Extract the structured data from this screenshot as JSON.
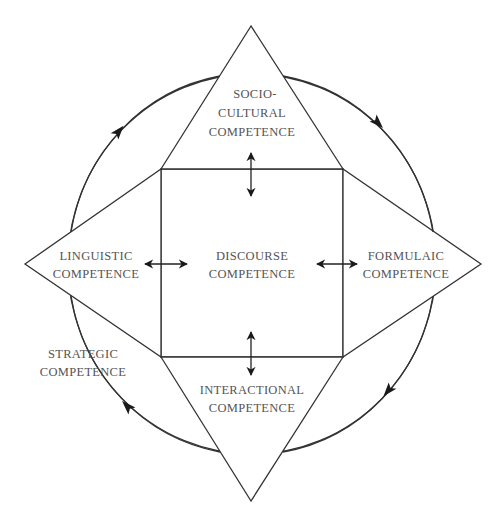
{
  "diagram": {
    "type": "model",
    "center": {
      "id": "discourse",
      "lines": [
        "DISCOURSE",
        "COMPETENCE"
      ]
    },
    "nodes": [
      {
        "id": "sociocultural",
        "position": "top",
        "lines": [
          "SOCIO-",
          "CULTURAL",
          "COMPETENCE"
        ]
      },
      {
        "id": "linguistic",
        "position": "left",
        "lines": [
          "LINGUISTIC",
          "COMPETENCE"
        ]
      },
      {
        "id": "formulaic",
        "position": "right",
        "lines": [
          "FORMULAIC",
          "COMPETENCE"
        ]
      },
      {
        "id": "interactional",
        "position": "bottom",
        "lines": [
          "INTERACTIONAL",
          "COMPETENCE"
        ]
      }
    ],
    "outer": {
      "id": "strategic",
      "lines": [
        "STRATEGIC",
        "COMPETENCE"
      ],
      "shape": "circle",
      "direction": "clockwise"
    },
    "edges": [
      {
        "from": "discourse",
        "to": "sociocultural",
        "type": "bidirectional"
      },
      {
        "from": "discourse",
        "to": "linguistic",
        "type": "bidirectional"
      },
      {
        "from": "discourse",
        "to": "formulaic",
        "type": "bidirectional"
      },
      {
        "from": "discourse",
        "to": "interactional",
        "type": "bidirectional"
      }
    ],
    "colors": {
      "stroke": "#333333",
      "text": "#555555",
      "background": "#ffffff"
    }
  }
}
